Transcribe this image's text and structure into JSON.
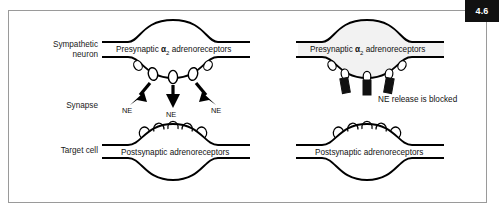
{
  "figure": {
    "number": "4.6",
    "row_labels": [
      {
        "id": "sympathetic-neuron",
        "line1": "Sympathetic",
        "line2": "neuron"
      },
      {
        "id": "synapse",
        "line1": "Synapse",
        "line2": ""
      },
      {
        "id": "target-cell",
        "line1": "Target cell",
        "line2": ""
      }
    ],
    "panels": [
      {
        "id": "normal-release",
        "presynaptic_label_prefix": "Presynaptic ",
        "presynaptic_label_greek": "α",
        "presynaptic_label_sub": "2",
        "presynaptic_label_suffix": " adrenoreceptors",
        "postsynaptic_label": "Postsynaptic adrenoreceptors",
        "neurotransmitter_tags": [
          "NE",
          "NE",
          "NE"
        ],
        "status_text": ""
      },
      {
        "id": "blocked-release",
        "presynaptic_label_prefix": "Presynaptic ",
        "presynaptic_label_greek": "α",
        "presynaptic_label_sub": "2",
        "presynaptic_label_suffix": " adrenoreceptors",
        "postsynaptic_label": "Postsynaptic adrenoreceptors",
        "neurotransmitter_tags": [],
        "status_text": "NE release is blocked"
      }
    ]
  },
  "colors": {
    "frame_border": "#9a9a9a",
    "badge_background": "#111111",
    "badge_text": "#ffffff",
    "ink": "#000000",
    "terminal_tint": "#f2f2f2"
  }
}
